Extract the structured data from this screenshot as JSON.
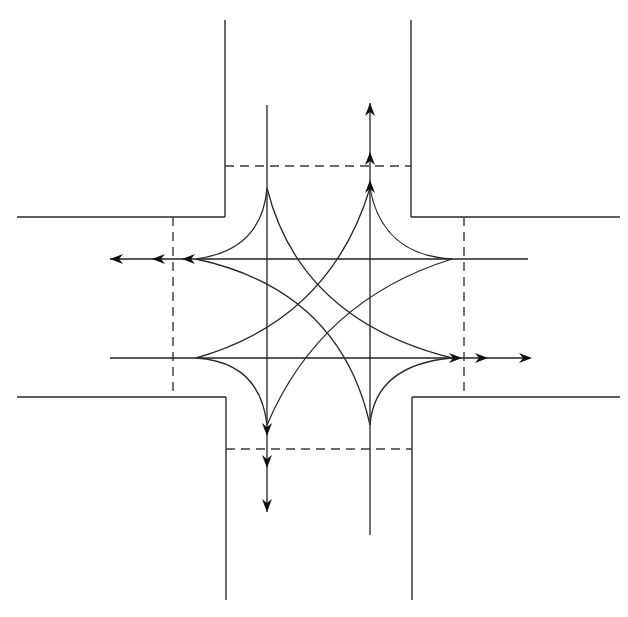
{
  "diagram": {
    "title": "",
    "type": "four-way intersection traffic movement diagram",
    "colors": {
      "background": "#ffffff",
      "line": "#2a2a2a",
      "arrow": "#111111"
    },
    "road_edges": [
      {
        "name": "north-road-left-edge",
        "x1": 225,
        "y1": 20,
        "x2": 225,
        "y2": 217
      },
      {
        "name": "north-road-right-edge",
        "x1": 411,
        "y1": 20,
        "x2": 411,
        "y2": 217
      },
      {
        "name": "west-road-top-edge",
        "x1": 17,
        "y1": 217,
        "x2": 225,
        "y2": 217
      },
      {
        "name": "east-road-top-edge",
        "x1": 411,
        "y1": 217,
        "x2": 620,
        "y2": 217
      },
      {
        "name": "west-road-bottom-edge",
        "x1": 17,
        "y1": 397,
        "x2": 226,
        "y2": 397
      },
      {
        "name": "east-road-bottom-edge",
        "x1": 412,
        "y1": 397,
        "x2": 620,
        "y2": 397
      },
      {
        "name": "south-road-left-edge",
        "x1": 226,
        "y1": 397,
        "x2": 226,
        "y2": 600
      },
      {
        "name": "south-road-right-edge",
        "x1": 412,
        "y1": 397,
        "x2": 412,
        "y2": 600
      }
    ],
    "stop_lines": [
      {
        "name": "north-stop-line",
        "x1": 225,
        "y1": 166,
        "x2": 411,
        "y2": 166
      },
      {
        "name": "south-stop-line",
        "x1": 226,
        "y1": 449,
        "x2": 412,
        "y2": 449
      },
      {
        "name": "west-stop-line",
        "x1": 173,
        "y1": 217,
        "x2": 173,
        "y2": 397
      },
      {
        "name": "east-stop-line",
        "x1": 464,
        "y1": 217,
        "x2": 464,
        "y2": 397
      }
    ],
    "lanes": [
      {
        "name": "southbound-through-lane",
        "x1": 267,
        "y1": 105,
        "x2": 267,
        "y2": 512
      },
      {
        "name": "northbound-through-lane",
        "x1": 370,
        "y1": 535,
        "x2": 370,
        "y2": 103
      },
      {
        "name": "westbound-through-lane",
        "x1": 528,
        "y1": 259,
        "x2": 110,
        "y2": 259
      },
      {
        "name": "eastbound-through-lane",
        "x1": 110,
        "y1": 358,
        "x2": 530,
        "y2": 358
      }
    ],
    "turn_curves": [
      {
        "name": "southbound-right-turn",
        "d": "M267,188 Q262,250 196,259"
      },
      {
        "name": "southbound-left-turn",
        "d": "M267,188 Q300,320 452,358"
      },
      {
        "name": "northbound-right-turn",
        "d": "M370,425 Q375,365 452,358"
      },
      {
        "name": "northbound-left-turn",
        "d": "M370,425 Q340,290 196,259"
      },
      {
        "name": "westbound-right-turn",
        "d": "M452,259 Q382,255 370,188"
      },
      {
        "name": "westbound-left-turn",
        "d": "M452,259 Q320,300 267,425"
      },
      {
        "name": "eastbound-right-turn",
        "d": "M196,358 Q260,362 267,425"
      },
      {
        "name": "eastbound-left-turn",
        "d": "M196,358 Q330,320 370,188"
      }
    ],
    "arrowheads": [
      {
        "name": "north-exit-arrow-1",
        "x": 370,
        "y": 103,
        "dir": "up"
      },
      {
        "name": "north-exit-arrow-2",
        "x": 370,
        "y": 152,
        "dir": "up"
      },
      {
        "name": "north-exit-arrow-3",
        "x": 370,
        "y": 180,
        "dir": "up"
      },
      {
        "name": "west-exit-arrow-1",
        "x": 110,
        "y": 259,
        "dir": "left"
      },
      {
        "name": "west-exit-arrow-2",
        "x": 152,
        "y": 259,
        "dir": "left"
      },
      {
        "name": "west-exit-arrow-3",
        "x": 182,
        "y": 259,
        "dir": "left"
      },
      {
        "name": "east-exit-arrow-1",
        "x": 532,
        "y": 358,
        "dir": "right"
      },
      {
        "name": "east-exit-arrow-2",
        "x": 488,
        "y": 358,
        "dir": "right"
      },
      {
        "name": "east-exit-arrow-3",
        "x": 462,
        "y": 358,
        "dir": "right"
      },
      {
        "name": "south-exit-arrow-1",
        "x": 267,
        "y": 512,
        "dir": "down"
      },
      {
        "name": "south-exit-arrow-2",
        "x": 267,
        "y": 468,
        "dir": "down"
      },
      {
        "name": "south-exit-arrow-3",
        "x": 267,
        "y": 436,
        "dir": "down"
      }
    ]
  }
}
